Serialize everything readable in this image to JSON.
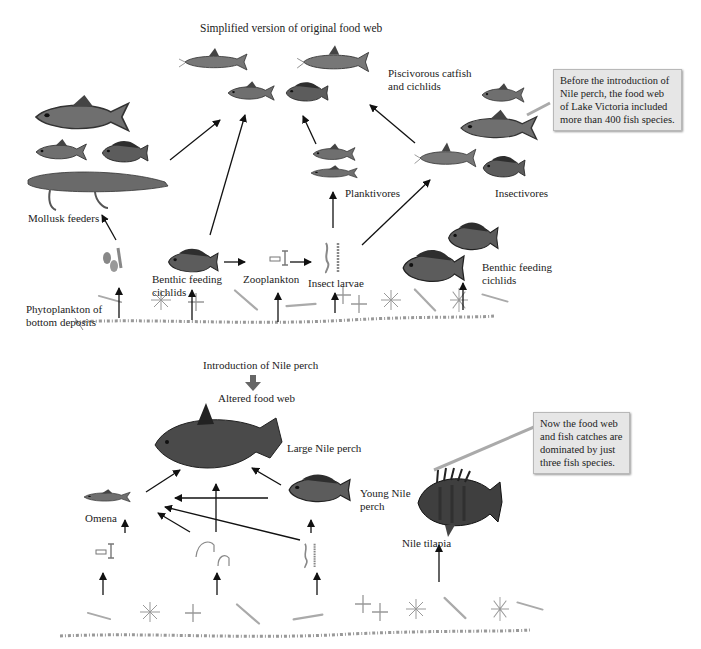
{
  "top_web": {
    "title": "Simplified version of original food web",
    "labels": {
      "piscivores": [
        "Piscivorous catfish",
        "and cichlids"
      ],
      "mollusk_feeders": "Mollusk feeders",
      "benthic_cichlids_left": [
        "Benthic feeding",
        "cichlids"
      ],
      "zooplankton": "Zooplankton",
      "insect_larvae": "Insect larvae",
      "planktivores": "Planktivores",
      "insectivores": "Insectivores",
      "benthic_cichlids_right": [
        "Benthic feeding",
        "cichlids"
      ],
      "phytoplankton": [
        "Phytoplankton of",
        "bottom deposits"
      ]
    },
    "callout": [
      "Before the introduction of",
      "Nile perch, the food web",
      "of Lake Victoria included",
      "more than 400 fish species."
    ]
  },
  "transition": {
    "label": "Introduction of Nile perch",
    "arrow_color": "#666666"
  },
  "bottom_web": {
    "title": "Altered food web",
    "labels": {
      "large_perch": "Large Nile perch",
      "young_perch": [
        "Young Nile",
        "perch"
      ],
      "omena": "Omena",
      "tilapia": "Nile tilapia"
    },
    "callout": [
      "Now  the food web",
      "and fish catches are",
      "dominated by just",
      "three fish species."
    ]
  },
  "colors": {
    "callout_bg": "#e6e6e6",
    "arrow": "#111111",
    "fish_body": "#6f6f6f",
    "fish_dark": "#3a3a3a",
    "plankton": "#9a9a9a"
  }
}
